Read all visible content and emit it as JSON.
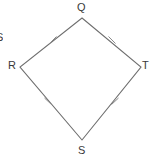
{
  "figure": {
    "shape_name": "QRST",
    "stroke_color": "#6e6e6e",
    "tick_color": "#8a8a8a",
    "text_color": "#3a3a3a",
    "background_color": "#ffffff",
    "canvas": {
      "width": 156,
      "height": 161
    },
    "vertices": [
      {
        "name": "Q",
        "label": "Q",
        "x": 82,
        "y": 18,
        "label_x": 77,
        "label_y": 2
      },
      {
        "name": "R",
        "label": "R",
        "x": 20,
        "y": 67,
        "label_x": 8,
        "label_y": 60
      },
      {
        "name": "T",
        "label": "T",
        "x": 141,
        "y": 67,
        "label_x": 142,
        "label_y": 60
      },
      {
        "name": "S",
        "label": "S",
        "x": 82,
        "y": 140,
        "label_x": 78,
        "label_y": 145
      }
    ],
    "sides": [
      {
        "name": "QR",
        "from": "Q",
        "to": "R",
        "tick_marks": 1,
        "tick_x": 53,
        "tick_y": 40
      },
      {
        "name": "QT",
        "from": "Q",
        "to": "T",
        "tick_marks": 1,
        "tick_x": 112,
        "tick_y": 40
      },
      {
        "name": "RS",
        "from": "R",
        "to": "S",
        "tick_marks": 1,
        "tick_x": 48,
        "tick_y": 101
      },
      {
        "name": "TS",
        "from": "T",
        "to": "S",
        "tick_marks": 1,
        "tick_x": 115,
        "tick_y": 101
      }
    ],
    "cut_off_label": "S"
  }
}
